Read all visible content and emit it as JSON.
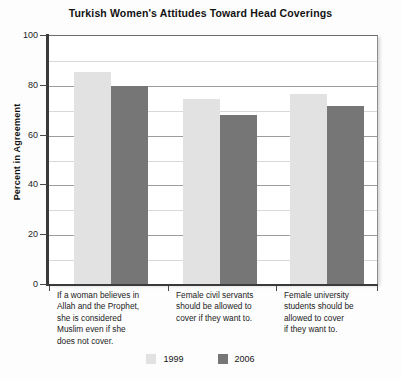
{
  "chart_data": {
    "type": "bar",
    "title": "Turkish Women's Attitudes Toward Head Coverings",
    "xlabel": "",
    "ylabel": "Percent in Agreement",
    "ylim": [
      0,
      100
    ],
    "yticks": [
      0,
      20,
      40,
      60,
      80,
      100
    ],
    "ytick_labels": [
      "0",
      "20",
      "40",
      "60",
      "80",
      "100"
    ],
    "minor_tick_interval": 10,
    "grid": true,
    "legend_position": "bottom-center",
    "categories": [
      "If a woman believes in Allah and the Prophet, she is considered Muslim even if she does not cover.",
      "Female civil servants should be allowed to cover if they want to.",
      "Female university students should be allowed to cover if they want to."
    ],
    "category_lines": [
      [
        "If a woman believes in",
        "Allah and the Prophet,",
        "she is considered",
        "Muslim even if she",
        "does not cover."
      ],
      [
        "Female civil servants",
        "should be allowed to",
        "cover if they want to."
      ],
      [
        "Female university",
        "students should be",
        "allowed to cover",
        "if they want to."
      ]
    ],
    "series": [
      {
        "name": "1999",
        "color": "#e2e2e2",
        "values": [
          85,
          74.5,
          76.5
        ]
      },
      {
        "name": "2006",
        "color": "#767676",
        "values": [
          79.5,
          68,
          71.5
        ]
      }
    ]
  },
  "legend": {
    "entries": [
      {
        "label": "1999",
        "color": "#e2e2e2"
      },
      {
        "label": "2006",
        "color": "#767676"
      }
    ]
  }
}
